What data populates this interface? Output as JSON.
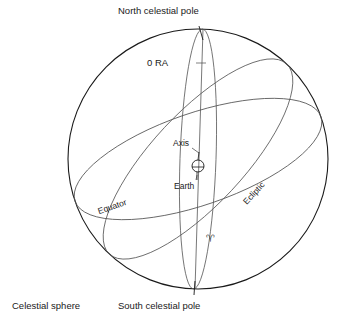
{
  "figure": {
    "caption": "Celestial sphere",
    "labels": {
      "north_pole": "North celestial pole",
      "south_pole": "South celestial pole",
      "ra_zero": "0  RA",
      "axis": "Axis",
      "earth": "Earth",
      "equator": "Equator",
      "ecliptic": "Ecliptic",
      "vernal_equinox": "♈"
    },
    "colors": {
      "background": "#ffffff",
      "outline": "#1a1a1a",
      "circle_line": "#3a3a3a",
      "text": "#1a1a1a",
      "faint_line": "#6a6a6a"
    },
    "geometry": {
      "sphere_center_x": 198,
      "sphere_center_y": 159,
      "sphere_radius": 130,
      "earth_radius": 6,
      "equator_tilt_deg": -19,
      "ecliptic_tilt_deg": -42
    }
  }
}
